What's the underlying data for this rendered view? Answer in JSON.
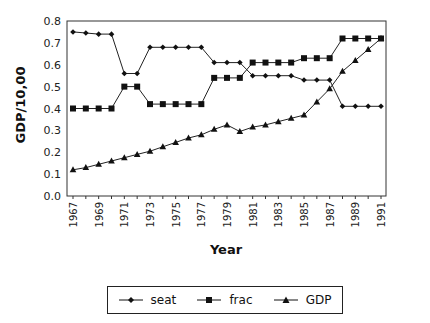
{
  "chart_data": {
    "type": "line",
    "title": "",
    "xlabel": "Year",
    "ylabel": "GDP/10,00",
    "ylim": [
      0.0,
      0.8
    ],
    "yticks": [
      "0.0",
      "0.1",
      "0.2",
      "0.3",
      "0.4",
      "0.5",
      "0.6",
      "0.7",
      "0.8"
    ],
    "x": [
      1967,
      1968,
      1969,
      1970,
      1971,
      1972,
      1973,
      1974,
      1975,
      1976,
      1977,
      1978,
      1979,
      1980,
      1981,
      1982,
      1983,
      1984,
      1985,
      1986,
      1987,
      1988,
      1989,
      1990,
      1991
    ],
    "xtick_labels": [
      "1967",
      "1969",
      "1971",
      "1973",
      "1975",
      "1977",
      "1979",
      "1981",
      "1983",
      "1985",
      "1987",
      "1989",
      "1991"
    ],
    "grid": false,
    "legend_position": "bottom",
    "series": [
      {
        "name": "seat",
        "marker": "diamond",
        "values": [
          0.75,
          0.745,
          0.74,
          0.74,
          0.56,
          0.56,
          0.68,
          0.68,
          0.68,
          0.68,
          0.68,
          0.61,
          0.61,
          0.61,
          0.55,
          0.55,
          0.55,
          0.55,
          0.53,
          0.53,
          0.53,
          0.41,
          0.41,
          0.41,
          0.41
        ]
      },
      {
        "name": "frac",
        "marker": "square",
        "values": [
          0.4,
          0.4,
          0.4,
          0.4,
          0.5,
          0.5,
          0.42,
          0.42,
          0.42,
          0.42,
          0.42,
          0.54,
          0.54,
          0.54,
          0.61,
          0.61,
          0.61,
          0.61,
          0.63,
          0.63,
          0.63,
          0.72,
          0.72,
          0.72,
          0.72
        ]
      },
      {
        "name": "GDP",
        "marker": "triangle",
        "values": [
          0.12,
          0.13,
          0.145,
          0.16,
          0.175,
          0.19,
          0.205,
          0.225,
          0.245,
          0.265,
          0.28,
          0.305,
          0.325,
          0.295,
          0.315,
          0.325,
          0.34,
          0.355,
          0.37,
          0.43,
          0.49,
          0.57,
          0.62,
          0.67,
          0.72
        ]
      }
    ]
  },
  "legend": {
    "items": [
      "seat",
      "frac",
      "GDP"
    ]
  }
}
